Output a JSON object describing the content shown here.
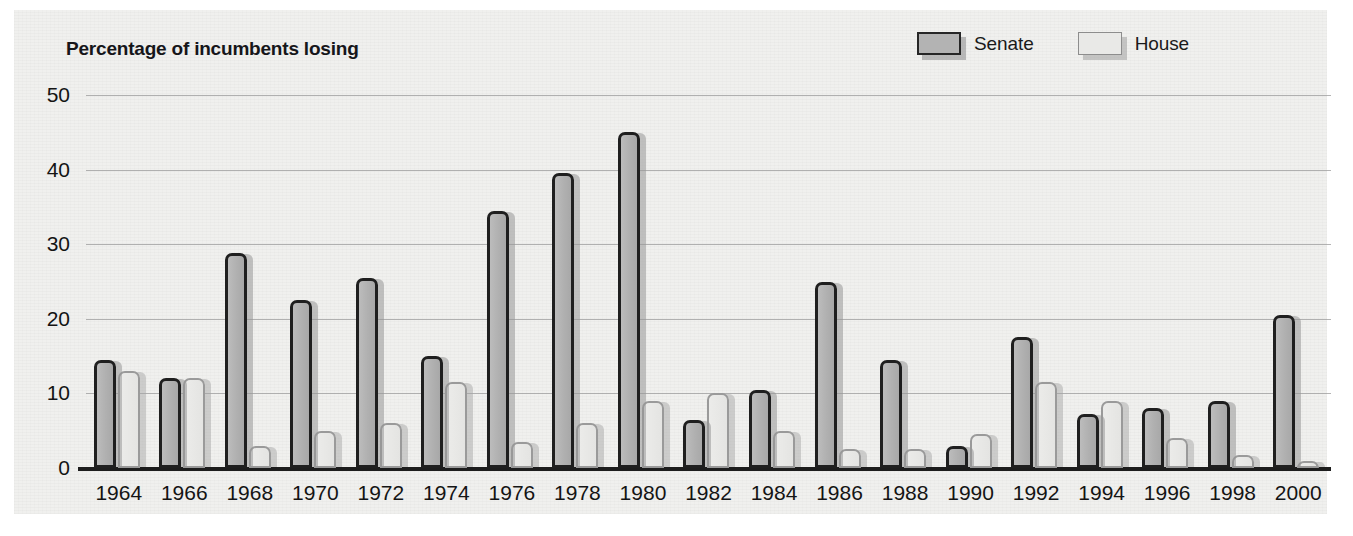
{
  "chart_data": {
    "type": "bar",
    "title": "Percentage of incumbents losing",
    "xlabel": "",
    "ylabel": "",
    "ylim": [
      0,
      50
    ],
    "yticks": [
      0,
      10,
      20,
      30,
      40,
      50
    ],
    "grid": true,
    "legend_position": "top-right",
    "categories": [
      "1964",
      "1966",
      "1968",
      "1970",
      "1972",
      "1974",
      "1976",
      "1978",
      "1980",
      "1982",
      "1984",
      "1986",
      "1988",
      "1990",
      "1992",
      "1994",
      "1996",
      "1998",
      "2000"
    ],
    "series": [
      {
        "name": "Senate",
        "color": "#b3b3b3",
        "values": [
          14.5,
          12.0,
          28.8,
          22.5,
          25.5,
          15.0,
          34.5,
          39.5,
          45.0,
          6.5,
          10.5,
          25.0,
          14.5,
          3.0,
          17.5,
          7.3,
          8.0,
          9.0,
          20.5
        ]
      },
      {
        "name": "House",
        "color": "#e9e9e7",
        "values": [
          13.0,
          12.0,
          3.0,
          5.0,
          6.0,
          11.5,
          3.5,
          6.0,
          9.0,
          10.0,
          5.0,
          2.5,
          2.5,
          4.5,
          11.5,
          9.0,
          4.0,
          1.8,
          1.0
        ]
      }
    ]
  },
  "legend": {
    "items": [
      {
        "label": "Senate",
        "swatch": "senate"
      },
      {
        "label": "House",
        "swatch": "house"
      }
    ]
  }
}
